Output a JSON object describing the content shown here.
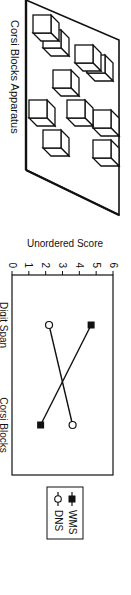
{
  "figure": {
    "orientation": "rotated 90deg clockwise",
    "apparatus": {
      "caption": "Corsi Blocks Apparatus"
    }
  },
  "chart_data": {
    "type": "line",
    "title": "",
    "xlabel": "",
    "ylabel": "Unordered Score",
    "categories": [
      "Digit Span",
      "Corsi Blocks"
    ],
    "series": [
      {
        "name": "WMS",
        "marker": "filled-square",
        "values": [
          4.7,
          1.7
        ]
      },
      {
        "name": "DNS",
        "marker": "open-circle",
        "values": [
          2.2,
          3.6
        ]
      }
    ],
    "ylim": [
      0,
      6
    ],
    "yticks": [
      "0",
      "1",
      "2",
      "3",
      "4",
      "5",
      "6"
    ],
    "grid": false,
    "legend_position": "right, outside plot"
  }
}
